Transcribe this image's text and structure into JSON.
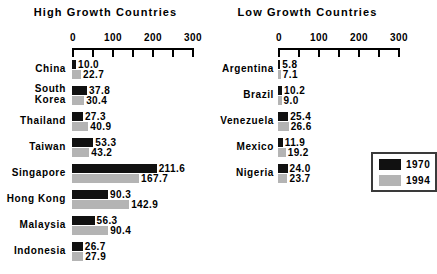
{
  "chart_data": {
    "type": "bar",
    "orientation": "horizontal",
    "title": "",
    "xlabel": "",
    "ylabel": "",
    "xlim": [
      0,
      300
    ],
    "grid": false,
    "tick_values": [
      0,
      50,
      100,
      150,
      200,
      250,
      300
    ],
    "tick_labels_shown": [
      "0",
      "100",
      "200",
      "300"
    ],
    "legend": {
      "position": "right-middle",
      "entries": [
        {
          "name": "1970",
          "color": "#111111"
        },
        {
          "name": "1994",
          "color": "#b4b4b4"
        }
      ]
    },
    "panels": [
      {
        "title": "High Growth Countries",
        "categories": [
          "China",
          "South\nKorea",
          "Thailand",
          "Taiwan",
          "Singapore",
          "Hong Kong",
          "Malaysia",
          "Indonesia"
        ],
        "series": [
          {
            "name": "1970",
            "color": "#111111",
            "values": [
              10.0,
              37.8,
              27.3,
              53.3,
              211.6,
              90.3,
              56.3,
              26.7
            ]
          },
          {
            "name": "1994",
            "color": "#b4b4b4",
            "values": [
              22.7,
              30.4,
              40.9,
              43.2,
              167.7,
              142.9,
              90.4,
              27.9
            ]
          }
        ]
      },
      {
        "title": "Low Growth Countries",
        "categories": [
          "Argentina",
          "Brazil",
          "Venezuela",
          "Mexico",
          "Nigeria"
        ],
        "series": [
          {
            "name": "1970",
            "color": "#111111",
            "values": [
              5.8,
              10.2,
              25.4,
              11.9,
              24.0
            ]
          },
          {
            "name": "1994",
            "color": "#b4b4b4",
            "values": [
              7.1,
              9.0,
              26.6,
              19.2,
              23.7
            ]
          }
        ]
      }
    ]
  },
  "left": {
    "title": "High Growth Countries",
    "axis": {
      "ticks": [
        {
          "label": "0",
          "value": 0
        },
        {
          "label": "",
          "value": 50
        },
        {
          "label": "100",
          "value": 100
        },
        {
          "label": "",
          "value": 150
        },
        {
          "label": "200",
          "value": 200
        },
        {
          "label": "",
          "value": 250
        },
        {
          "label": "300",
          "value": 300
        }
      ]
    },
    "rows": [
      {
        "label": "China",
        "v1970": "10.0",
        "v1994": "22.7",
        "n1970": 10.0,
        "n1994": 22.7
      },
      {
        "label": "South\nKorea",
        "v1970": "37.8",
        "v1994": "30.4",
        "n1970": 37.8,
        "n1994": 30.4
      },
      {
        "label": "Thailand",
        "v1970": "27.3",
        "v1994": "40.9",
        "n1970": 27.3,
        "n1994": 40.9
      },
      {
        "label": "Taiwan",
        "v1970": "53.3",
        "v1994": "43.2",
        "n1970": 53.3,
        "n1994": 43.2
      },
      {
        "label": "Singapore",
        "v1970": "211.6",
        "v1994": "167.7",
        "n1970": 211.6,
        "n1994": 167.7
      },
      {
        "label": "Hong Kong",
        "v1970": "90.3",
        "v1994": "142.9",
        "n1970": 90.3,
        "n1994": 142.9
      },
      {
        "label": "Malaysia",
        "v1970": "56.3",
        "v1994": "90.4",
        "n1970": 56.3,
        "n1994": 90.4
      },
      {
        "label": "Indonesia",
        "v1970": "26.7",
        "v1994": "27.9",
        "n1970": 26.7,
        "n1994": 27.9
      }
    ]
  },
  "right": {
    "title": "Low Growth Countries",
    "axis": {
      "ticks": [
        {
          "label": "0",
          "value": 0
        },
        {
          "label": "",
          "value": 50
        },
        {
          "label": "100",
          "value": 100
        },
        {
          "label": "",
          "value": 150
        },
        {
          "label": "200",
          "value": 200
        },
        {
          "label": "",
          "value": 250
        },
        {
          "label": "300",
          "value": 300
        }
      ]
    },
    "rows": [
      {
        "label": "Argentina",
        "v1970": "5.8",
        "v1994": "7.1",
        "n1970": 5.8,
        "n1994": 7.1
      },
      {
        "label": "Brazil",
        "v1970": "10.2",
        "v1994": "9.0",
        "n1970": 10.2,
        "n1994": 9.0
      },
      {
        "label": "Venezuela",
        "v1970": "25.4",
        "v1994": "26.6",
        "n1970": 25.4,
        "n1994": 26.6
      },
      {
        "label": "Mexico",
        "v1970": "11.9",
        "v1994": "19.2",
        "n1970": 11.9,
        "n1994": 19.2
      },
      {
        "label": "Nigeria",
        "v1970": "24.0",
        "v1994": "23.7",
        "n1970": 24.0,
        "n1994": 23.7
      }
    ]
  },
  "legend": {
    "entries": [
      {
        "label": "1970",
        "color": "#111111"
      },
      {
        "label": "1994",
        "color": "#b4b4b4"
      }
    ]
  }
}
